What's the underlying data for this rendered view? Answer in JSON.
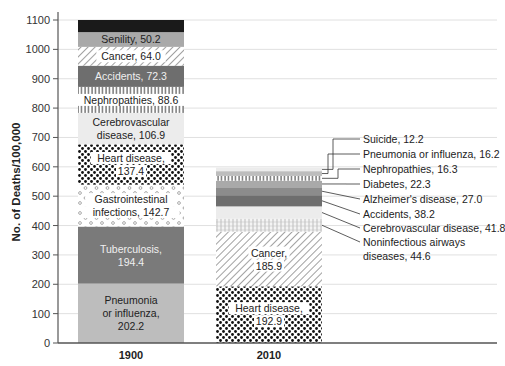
{
  "chart_data": {
    "type": "bar",
    "stacked": true,
    "title": "",
    "xlabel": "",
    "ylabel": "No. of Deaths/100,000",
    "ylim": [
      0,
      1100
    ],
    "yticks": [
      0,
      100,
      200,
      300,
      400,
      500,
      600,
      700,
      800,
      900,
      1000,
      1100
    ],
    "grid": "horizontal",
    "categories": [
      "1900",
      "2010"
    ],
    "bars": [
      {
        "category": "1900",
        "segments": [
          {
            "name": "Pneumonia or influenza",
            "value": 202.2,
            "label": [
              "Pneumonia",
              "or influenza,",
              "202.2"
            ],
            "fill": "light-gray"
          },
          {
            "name": "Tuberculosis",
            "value": 194.4,
            "label": [
              "Tuberculosis,",
              "194.4"
            ],
            "fill": "dark-gray"
          },
          {
            "name": "Gastrointestinal infections",
            "value": 142.7,
            "label": [
              "Gastrointestinal",
              "infections, 142.7"
            ],
            "fill": "circles"
          },
          {
            "name": "Heart disease",
            "value": 137.4,
            "label": [
              "Heart disease,",
              "137.4"
            ],
            "fill": "dots"
          },
          {
            "name": "Cerebrovascular disease",
            "value": 106.9,
            "label": [
              "Cerebrovascular",
              "disease, 106.9"
            ],
            "fill": "very-light-gray"
          },
          {
            "name": "Nephropathies",
            "value": 88.6,
            "label": [
              "Nephropathies, 88.6"
            ],
            "fill": "vertical-lines"
          },
          {
            "name": "Accidents",
            "value": 72.3,
            "label": [
              "Accidents, 72.3"
            ],
            "fill": "medium-dark-gray"
          },
          {
            "name": "Cancer",
            "value": 64.0,
            "label": [
              "Cancer, 64.0"
            ],
            "fill": "diagonal-hatch"
          },
          {
            "name": "Senility",
            "value": 50.2,
            "label": [
              "Senility, 50.2"
            ],
            "fill": "mid-gray"
          },
          {
            "name": "",
            "value": 41.3,
            "label": [],
            "fill": "black"
          }
        ]
      },
      {
        "category": "2010",
        "segments": [
          {
            "name": "Heart disease",
            "value": 192.9,
            "label": [
              "Heart disease,",
              "192.9"
            ],
            "fill": "dots"
          },
          {
            "name": "Cancer",
            "value": 185.9,
            "label": [
              "Cancer,",
              "185.9"
            ],
            "fill": "diagonal-hatch"
          },
          {
            "name": "Noninfectious airways diseases",
            "value": 44.6,
            "label": [
              "Noninfectious airways",
              "diseases, 44.6"
            ],
            "fill": "grid"
          },
          {
            "name": "Cerebrovascular disease",
            "value": 41.8,
            "label": [
              "Cerebrovascular disease, 41.8"
            ],
            "fill": "very-light-gray"
          },
          {
            "name": "Accidents",
            "value": 38.2,
            "label": [
              "Accidents, 38.2"
            ],
            "fill": "medium-dark-gray"
          },
          {
            "name": "Alzheimer's disease",
            "value": 27.0,
            "label": [
              "Alzheimer's disease, 27.0"
            ],
            "fill": "gray"
          },
          {
            "name": "Diabetes",
            "value": 22.3,
            "label": [
              "Diabetes, 22.3"
            ],
            "fill": "mid-gray"
          },
          {
            "name": "Nephropathies",
            "value": 16.3,
            "label": [
              "Nephropathies, 16.3"
            ],
            "fill": "vertical-lines"
          },
          {
            "name": "Pneumonia or influenza",
            "value": 16.2,
            "label": [
              "Pneumonia or influenza, 16.2"
            ],
            "fill": "light-gray"
          },
          {
            "name": "Suicide",
            "value": 12.2,
            "label": [
              "Suicide, 12.2"
            ],
            "fill": "very-light-gray"
          }
        ]
      }
    ]
  },
  "colors": {
    "black": "#1a1a1a",
    "mid-gray": "#a9a9a9",
    "medium-dark-gray": "#6e6e6e",
    "dark-gray": "#7a7a7a",
    "gray": "#8c8c8c",
    "light-gray": "#bdbdbd",
    "very-light-gray": "#ececec",
    "grid": "#e8e8e8",
    "axis": "#555555"
  }
}
